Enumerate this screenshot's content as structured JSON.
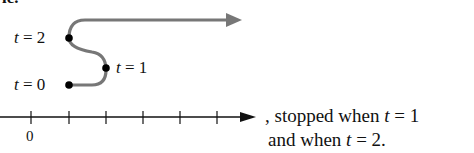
{
  "cropped_header": "le.",
  "path_diagram": {
    "labels": [
      {
        "var": "t",
        "eq": " = 2"
      },
      {
        "var": "t",
        "eq": " = 1"
      },
      {
        "var": "t",
        "eq": " = 0"
      }
    ],
    "colors": {
      "path": "#777777",
      "points": "#000000"
    }
  },
  "number_line": {
    "tick_label": "0",
    "tick_count": 6
  },
  "caption": {
    "line1_pre": ", stopped when ",
    "line1_var": "t",
    "line1_post": " = 1",
    "line2_pre": "and when ",
    "line2_var": "t",
    "line2_post": " = 2."
  }
}
